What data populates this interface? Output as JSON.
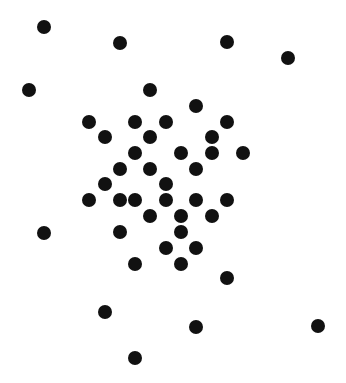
{
  "canvas": {
    "width": 346,
    "height": 383,
    "background": "#ffffff"
  },
  "dot_style": {
    "radius": 7,
    "color": "#111111"
  },
  "dots": [
    [
      44,
      27
    ],
    [
      120,
      43
    ],
    [
      227,
      42
    ],
    [
      288,
      58
    ],
    [
      29,
      90
    ],
    [
      150,
      90
    ],
    [
      196,
      106
    ],
    [
      89,
      122
    ],
    [
      135,
      122
    ],
    [
      166,
      122
    ],
    [
      227,
      122
    ],
    [
      105,
      137
    ],
    [
      150,
      137
    ],
    [
      212,
      137
    ],
    [
      135,
      153
    ],
    [
      181,
      153
    ],
    [
      212,
      153
    ],
    [
      243,
      153
    ],
    [
      120,
      169
    ],
    [
      150,
      169
    ],
    [
      196,
      169
    ],
    [
      105,
      184
    ],
    [
      166,
      184
    ],
    [
      89,
      200
    ],
    [
      120,
      200
    ],
    [
      135,
      200
    ],
    [
      166,
      200
    ],
    [
      196,
      200
    ],
    [
      227,
      200
    ],
    [
      150,
      216
    ],
    [
      181,
      216
    ],
    [
      212,
      216
    ],
    [
      44,
      233
    ],
    [
      120,
      232
    ],
    [
      181,
      232
    ],
    [
      166,
      248
    ],
    [
      196,
      248
    ],
    [
      135,
      264
    ],
    [
      181,
      264
    ],
    [
      227,
      278
    ],
    [
      105,
      312
    ],
    [
      196,
      327
    ],
    [
      318,
      326
    ],
    [
      135,
      358
    ]
  ]
}
